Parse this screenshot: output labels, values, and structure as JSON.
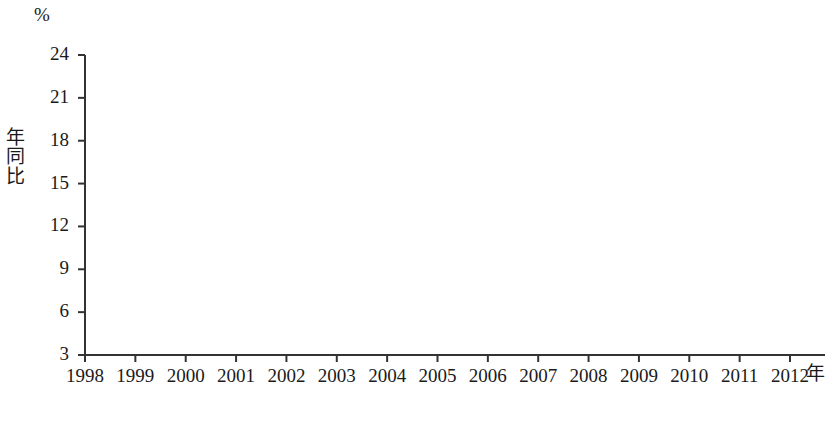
{
  "axis": {
    "unit": "%",
    "ylabel": "年同比",
    "xlabel": "年",
    "yticks": [
      "3",
      "6",
      "9",
      "12",
      "15",
      "18",
      "21",
      "24"
    ]
  },
  "legend": {
    "items": [
      {
        "label": "西部",
        "color": "#bdbdbd"
      },
      {
        "label": "中部",
        "color": "#8a8a8a"
      },
      {
        "label": "东部",
        "color": "#4a4a4a"
      }
    ]
  },
  "chart_data": {
    "type": "line",
    "title": "",
    "xlabel": "年",
    "ylabel": "年同比",
    "unit": "%",
    "xlim": [
      1998,
      2012
    ],
    "ylim": [
      3,
      24
    ],
    "ytick_step": 3,
    "grid": false,
    "legend_position": "bottom-center",
    "x": [
      1998,
      1999,
      2000,
      2001,
      2002,
      2003,
      2004,
      2005,
      2006,
      2007,
      2008,
      2009,
      2010,
      2011,
      2012
    ],
    "categories": [
      "1998",
      "1999",
      "2000",
      "2001",
      "2002",
      "2003",
      "2004",
      "2005",
      "2006",
      "2007",
      "2008",
      "2009",
      "2010",
      "2011",
      "2012"
    ],
    "series": [
      {
        "name": "西部",
        "color": "#bdbdbd",
        "values": [
          6.4,
          4.8,
          10.2,
          9.3,
          10.1,
          13.9,
          20.7,
          20.4,
          18.3,
          21.9,
          22.6,
          10.2,
          23.0,
          23.0,
          13.8
        ]
      },
      {
        "name": "中部",
        "color": "#8a8a8a",
        "values": [
          5.9,
          3.8,
          10.2,
          9.0,
          9.4,
          13.9,
          20.7,
          20.3,
          16.4,
          21.0,
          20.6,
          9.5,
          21.5,
          21.2,
          11.6
        ]
      },
      {
        "name": "东部",
        "color": "#4a4a4a",
        "values": [
          8.1,
          7.2,
          7.9,
          9.8,
          10.8,
          15.0,
          18.7,
          18.0,
          15.2,
          17.8,
          16.4,
          7.9,
          15.9,
          16.5,
          9.3
        ]
      }
    ]
  }
}
